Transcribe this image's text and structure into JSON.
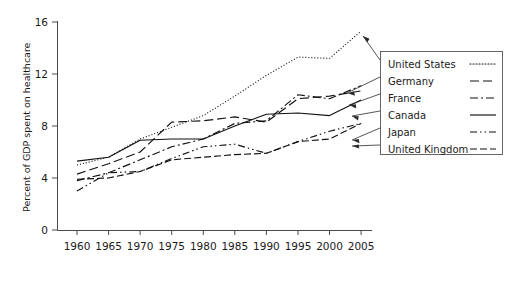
{
  "chart_data": {
    "type": "line",
    "title": "",
    "xlabel": "",
    "ylabel": "Percent of GDP spent on healthcare",
    "xlim": [
      1960,
      2005
    ],
    "ylim": [
      0,
      16
    ],
    "xticks": [
      1960,
      1965,
      1970,
      1975,
      1980,
      1985,
      1990,
      1995,
      2000,
      2005
    ],
    "yticks": [
      0,
      4,
      8,
      12,
      16
    ],
    "grid": false,
    "legend_position": "right",
    "x": [
      1960,
      1965,
      1970,
      1975,
      1980,
      1985,
      1990,
      1995,
      2000,
      2005
    ],
    "series": [
      {
        "name": "United States",
        "dash": "dotted",
        "values": [
          5.0,
          5.6,
          7.0,
          7.9,
          8.8,
          10.3,
          11.9,
          13.3,
          13.2,
          15.3
        ]
      },
      {
        "name": "Germany",
        "dash": "dashed",
        "values": [
          4.3,
          5.1,
          6.0,
          8.3,
          8.4,
          8.7,
          8.3,
          10.1,
          10.3,
          10.7
        ]
      },
      {
        "name": "France",
        "dash": "dash-dot",
        "values": [
          3.8,
          4.4,
          5.4,
          6.4,
          7.0,
          8.2,
          8.4,
          10.4,
          10.1,
          11.1
        ]
      },
      {
        "name": "Canada",
        "dash": "solid",
        "values": [
          5.3,
          5.6,
          6.9,
          7.0,
          7.0,
          8.0,
          8.9,
          9.0,
          8.8,
          10.0
        ]
      },
      {
        "name": "Japan",
        "dash": "dash-dot-dot",
        "values": [
          3.0,
          4.4,
          4.5,
          5.5,
          6.4,
          6.6,
          5.9,
          6.8,
          7.6,
          8.2
        ]
      },
      {
        "name": "United Kingdom",
        "dash": "long-dash",
        "values": [
          3.9,
          4.0,
          4.5,
          5.4,
          5.6,
          5.8,
          5.9,
          6.8,
          7.0,
          8.2
        ]
      }
    ]
  },
  "axes": {
    "y_title": "Percent of GDP spent on healthcare",
    "y_tick_labels": [
      "0",
      "4",
      "8",
      "12",
      "16"
    ],
    "x_tick_labels": [
      "1960",
      "1965",
      "1970",
      "1975",
      "1980",
      "1985",
      "1990",
      "1995",
      "2000",
      "2005"
    ]
  },
  "legend": {
    "entries": [
      {
        "label": "United States"
      },
      {
        "label": "Germany"
      },
      {
        "label": "France"
      },
      {
        "label": "Canada"
      },
      {
        "label": "Japan"
      },
      {
        "label": "United Kingdom"
      }
    ]
  }
}
